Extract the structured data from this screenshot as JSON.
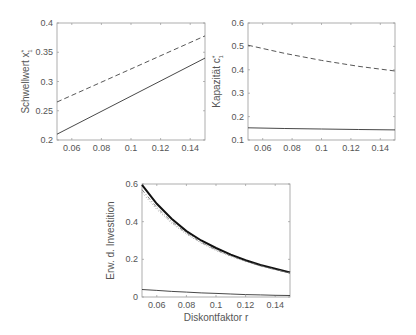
{
  "chart_data": [
    {
      "type": "line",
      "title": "",
      "xlabel": "",
      "ylabel": "Schwellwert x*",
      "xlim": [
        0.05,
        0.15
      ],
      "ylim": [
        0.2,
        0.4
      ],
      "xticks": [
        "0.06",
        "0.08",
        "0.1",
        "0.12",
        "0.14"
      ],
      "yticks": [
        "0.2",
        "0.25",
        "0.3",
        "0.35",
        "0.4"
      ],
      "grid": false,
      "x": [
        0.05,
        0.15
      ],
      "series": [
        {
          "name": "solid",
          "style": "solid",
          "values": [
            0.21,
            0.34
          ]
        },
        {
          "name": "dashed",
          "style": "dashed",
          "values": [
            0.265,
            0.378
          ]
        }
      ]
    },
    {
      "type": "line",
      "title": "",
      "xlabel": "",
      "ylabel": "Kapazität c*",
      "xlim": [
        0.05,
        0.15
      ],
      "ylim": [
        0.1,
        0.6
      ],
      "xticks": [
        "0.06",
        "0.08",
        "0.1",
        "0.12",
        "0.14"
      ],
      "yticks": [
        "0.1",
        "0.2",
        "0.3",
        "0.4",
        "0.5",
        "0.6"
      ],
      "grid": false,
      "x": [
        0.05,
        0.075,
        0.1,
        0.125,
        0.15
      ],
      "series": [
        {
          "name": "solid",
          "style": "solid",
          "values": [
            0.152,
            0.149,
            0.147,
            0.145,
            0.143
          ]
        },
        {
          "name": "dashed",
          "style": "dashed",
          "values": [
            0.505,
            0.47,
            0.44,
            0.415,
            0.395
          ]
        }
      ]
    },
    {
      "type": "line",
      "title": "",
      "xlabel": "Diskontfaktor r",
      "ylabel": "Erw. d. Investition",
      "xlim": [
        0.05,
        0.15
      ],
      "ylim": [
        0,
        0.6
      ],
      "xticks": [
        "0.06",
        "0.08",
        "0.1",
        "0.12",
        "0.14"
      ],
      "yticks": [
        "0",
        "0.2",
        "0.4",
        "0.6"
      ],
      "grid": false,
      "x": [
        0.05,
        0.06,
        0.07,
        0.08,
        0.09,
        0.1,
        0.11,
        0.12,
        0.13,
        0.14,
        0.15
      ],
      "series": [
        {
          "name": "thick solid",
          "style": "solid-thick",
          "values": [
            0.595,
            0.495,
            0.415,
            0.35,
            0.3,
            0.26,
            0.225,
            0.195,
            0.17,
            0.15,
            0.13
          ]
        },
        {
          "name": "dash-dot",
          "style": "dashdot",
          "values": [
            0.57,
            0.475,
            0.4,
            0.34,
            0.29,
            0.25,
            0.218,
            0.19,
            0.166,
            0.146,
            0.128
          ]
        },
        {
          "name": "dotted",
          "style": "dotted",
          "values": [
            0.555,
            0.465,
            0.392,
            0.334,
            0.286,
            0.247,
            0.215,
            0.188,
            0.164,
            0.145,
            0.127
          ]
        },
        {
          "name": "thin solid",
          "style": "solid",
          "values": [
            0.04,
            0.035,
            0.03,
            0.026,
            0.022,
            0.019,
            0.016,
            0.013,
            0.011,
            0.009,
            0.008
          ]
        }
      ]
    }
  ],
  "labels": {
    "p1_ylabel": "Schwellwert x",
    "p1_sup": "*",
    "p1_sub": "1",
    "p2_ylabel": "Kapazität c",
    "p2_sup": "*",
    "p2_sub": "1",
    "p3_ylabel": "Erw. d. Investition",
    "p3_xlabel": "Diskontfaktor r"
  }
}
